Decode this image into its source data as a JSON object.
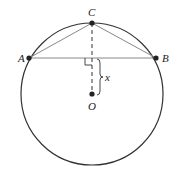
{
  "diagram": {
    "points": {
      "A": {
        "label": "A"
      },
      "B": {
        "label": "B"
      },
      "C": {
        "label": "C"
      },
      "O": {
        "label": "O"
      }
    },
    "segment_label": "x",
    "colors": {
      "circle": "#333333",
      "chord": "#888888",
      "dashed": "#333333",
      "point": "#222222"
    }
  }
}
